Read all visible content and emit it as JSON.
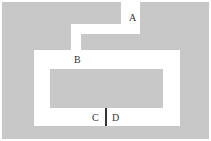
{
  "diagram": {
    "type": "maze-floor-plan",
    "colors": {
      "wall": "#c8c8c8",
      "path": "#ffffff",
      "divider": "#333333",
      "label": "#333333"
    },
    "labels": [
      {
        "id": "A",
        "text": "A"
      },
      {
        "id": "B",
        "text": "B"
      },
      {
        "id": "C",
        "text": "C"
      },
      {
        "id": "D",
        "text": "D"
      }
    ]
  }
}
